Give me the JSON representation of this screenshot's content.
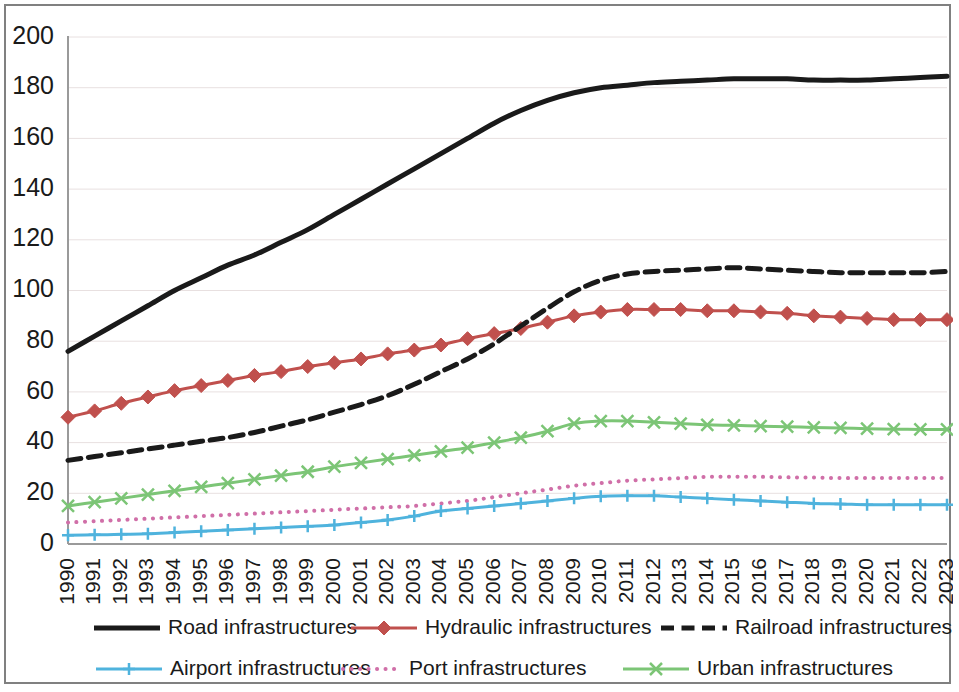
{
  "chart_data": {
    "type": "line",
    "title": "",
    "subtitle": "",
    "xlabel": "",
    "ylabel": "",
    "xlim": [
      1990,
      2023
    ],
    "ylim": [
      0,
      200
    ],
    "ytick_step": 20,
    "grid": true,
    "legend_position": "bottom",
    "x": [
      1990,
      1991,
      1992,
      1993,
      1994,
      1995,
      1996,
      1997,
      1998,
      1999,
      2000,
      2001,
      2002,
      2003,
      2004,
      2005,
      2006,
      2007,
      2008,
      2009,
      2010,
      2011,
      2012,
      2013,
      2014,
      2015,
      2016,
      2017,
      2018,
      2019,
      2020,
      2021,
      2022,
      2023
    ],
    "categories": [
      "1990",
      "1991",
      "1992",
      "1993",
      "1994",
      "1995",
      "1996",
      "1997",
      "1998",
      "1999",
      "2000",
      "2001",
      "2002",
      "2003",
      "2004",
      "2005",
      "2006",
      "2007",
      "2008",
      "2009",
      "2010",
      "2011",
      "2012",
      "2013",
      "2014",
      "2015",
      "2016",
      "2017",
      "2018",
      "2019",
      "2020",
      "2021",
      "2022",
      "2023"
    ],
    "ytick_labels": [
      "0",
      "20",
      "40",
      "60",
      "80",
      "100",
      "120",
      "140",
      "160",
      "180",
      "200"
    ],
    "ytick_values": [
      0,
      20,
      40,
      60,
      80,
      100,
      120,
      140,
      160,
      180,
      200
    ],
    "series": [
      {
        "name": "Road infrastructures",
        "color": "#1a1a1a",
        "style": "solid",
        "width": 5,
        "marker": "none",
        "values": [
          76,
          82,
          88,
          94,
          100,
          105,
          110,
          114,
          119,
          124,
          130,
          136,
          142,
          148,
          154,
          160,
          166,
          171,
          175,
          178,
          180,
          181,
          182,
          182.5,
          183,
          183.5,
          183.5,
          183.5,
          183,
          183,
          183,
          183.5,
          184,
          184.5
        ]
      },
      {
        "name": "Hydraulic infrastructures",
        "color": "#C0504D",
        "style": "solid",
        "width": 3,
        "marker": "diamond",
        "values": [
          50,
          52.5,
          55.5,
          58,
          60.5,
          62.5,
          64.5,
          66.5,
          68,
          70,
          71.5,
          73,
          75,
          76.5,
          78.5,
          81,
          83,
          85,
          87.5,
          90,
          91.5,
          92.5,
          92.5,
          92.5,
          92,
          92,
          91.5,
          91,
          90,
          89.5,
          89,
          88.5,
          88.5,
          88.5
        ]
      },
      {
        "name": "Railroad infrastructures",
        "color": "#1a1a1a",
        "style": "dashed",
        "width": 5,
        "marker": "none",
        "values": [
          33,
          34.5,
          36,
          37.5,
          39,
          40.5,
          42,
          44,
          46.5,
          49,
          52,
          55,
          58.5,
          63,
          68,
          73,
          79,
          86,
          93,
          99.5,
          104,
          106.5,
          107.5,
          108,
          108.5,
          109,
          108.5,
          108,
          107.5,
          107,
          107,
          107,
          107,
          107.5
        ]
      },
      {
        "name": "Airport infrastructures",
        "color": "#4FB3DD",
        "style": "solid",
        "width": 3,
        "marker": "plus",
        "values": [
          3.5,
          3.6,
          3.8,
          4,
          4.5,
          5,
          5.5,
          6,
          6.5,
          7,
          7.5,
          8.5,
          9.5,
          11,
          13,
          14,
          15,
          16,
          17,
          18,
          18.8,
          19,
          19,
          18.5,
          18,
          17.5,
          17,
          16.5,
          16,
          15.8,
          15.5,
          15.5,
          15.5,
          15.5
        ]
      },
      {
        "name": "Port infrastructures",
        "color": "#D06FA8",
        "style": "dotted",
        "width": 4,
        "marker": "none",
        "values": [
          8.5,
          9,
          9.5,
          10,
          10.5,
          11,
          11.5,
          12,
          12.5,
          13,
          13.5,
          14,
          14.5,
          15,
          16,
          17,
          18.5,
          20,
          21.5,
          23,
          24,
          25,
          25.5,
          26,
          26.5,
          26.5,
          26.5,
          26.3,
          26.2,
          26,
          26,
          26,
          26,
          26
        ]
      },
      {
        "name": "Urban infrastructures",
        "color": "#7CC576",
        "style": "solid",
        "width": 3,
        "marker": "cross",
        "values": [
          15,
          16.5,
          18,
          19.5,
          21,
          22.5,
          24,
          25.5,
          27,
          28.5,
          30.5,
          32,
          33.5,
          35,
          36.5,
          38,
          40,
          42,
          44.5,
          47.5,
          48.5,
          48.5,
          48,
          47.5,
          47,
          46.8,
          46.5,
          46.3,
          46,
          45.8,
          45.5,
          45.3,
          45.2,
          45.2
        ]
      }
    ]
  },
  "legend": {
    "row1": [
      {
        "label": "Road infrastructures"
      },
      {
        "label": "Hydraulic infrastructures"
      },
      {
        "label": "Railroad infrastructures"
      }
    ],
    "row2": [
      {
        "label": "Airport infrastructures"
      },
      {
        "label": "Port infrastructures"
      },
      {
        "label": "Urban infrastructures"
      }
    ]
  }
}
